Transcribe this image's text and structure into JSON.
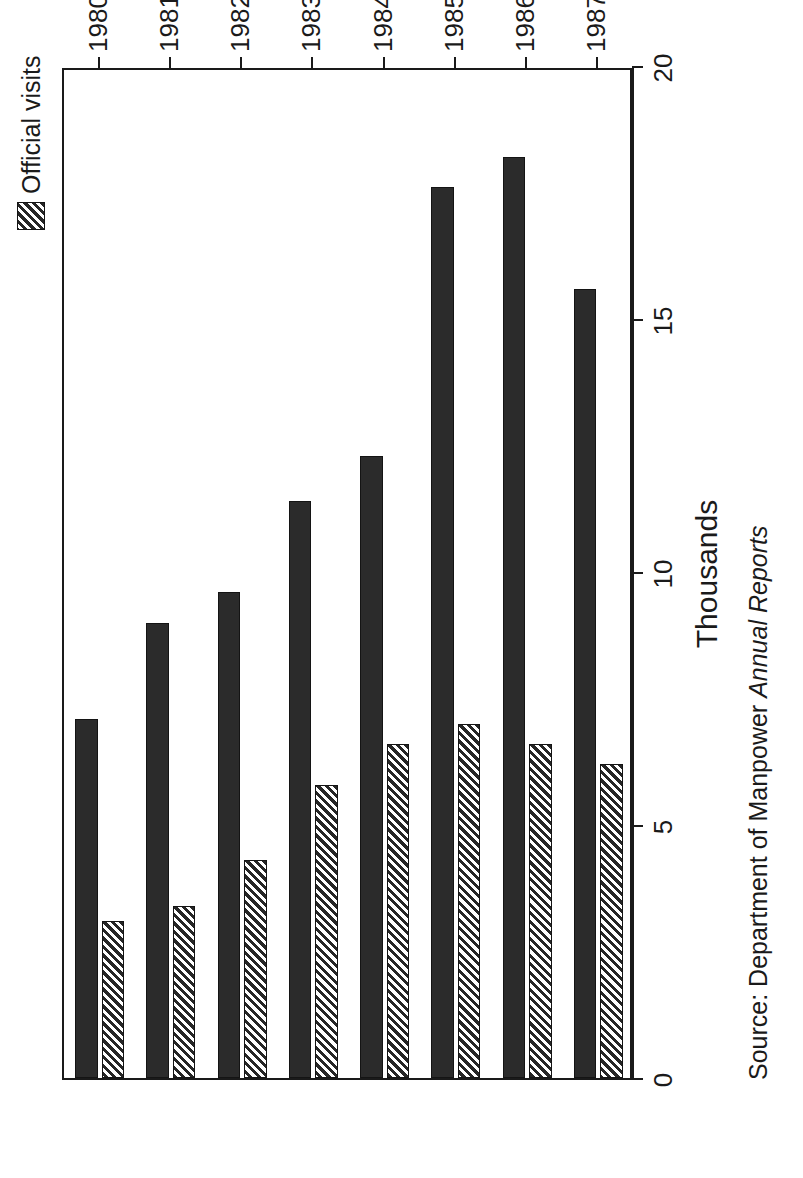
{
  "chart_data": {
    "type": "bar",
    "orientation": "vertical",
    "title": "",
    "xlabel": "",
    "ylabel": "Thousands",
    "ylim": [
      0,
      20
    ],
    "yticks": [
      "0",
      "5",
      "10",
      "15",
      "20"
    ],
    "grid": false,
    "legend_position": "top-right",
    "categories": [
      "1980",
      "1981",
      "1982",
      "1983",
      "1984",
      "1985",
      "1986",
      "1987"
    ],
    "series": [
      {
        "name": "Factory inspections",
        "fill": "solid-dark",
        "color": "#2b2b2b",
        "values": [
          7.1,
          9.0,
          9.6,
          11.4,
          12.3,
          17.6,
          18.2,
          15.6
        ]
      },
      {
        "name": "Official visits",
        "fill": "diagonal-hatch",
        "color": "#262626",
        "values": [
          3.1,
          3.4,
          4.3,
          5.8,
          6.6,
          7.0,
          6.6,
          6.2
        ]
      }
    ]
  },
  "axis": {
    "value_axis_title": "Thousands",
    "tick_labels": [
      "0",
      "5",
      "10",
      "15",
      "20"
    ],
    "category_labels": [
      "1980",
      "1981",
      "1982",
      "1983",
      "1984",
      "1985",
      "1986",
      "1987"
    ]
  },
  "legend": {
    "items": [
      {
        "label": "Factory inspections",
        "swatch": "solid-dark-swatch"
      },
      {
        "label": "Official visits",
        "swatch": "hatched-swatch"
      }
    ]
  },
  "source": {
    "prefix": "Source: Department of Manpower ",
    "italic": "Annual Reports"
  }
}
